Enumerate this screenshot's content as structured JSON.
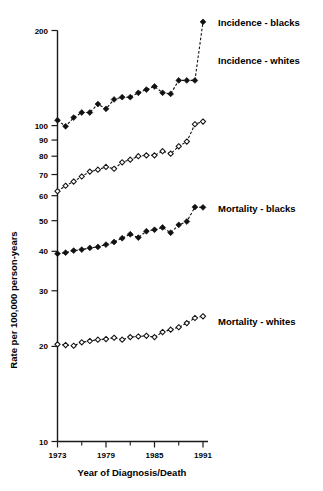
{
  "chart_data": {
    "type": "line",
    "title": "",
    "xlabel": "Year of Diagnosis/Death",
    "ylabel": "Rate per 100,000 person-years",
    "yscale": "log",
    "ylim": [
      10,
      230
    ],
    "xlim": [
      1972,
      1992
    ],
    "grid": false,
    "legend_position": "right-inline-labels",
    "y_ticks": [
      10,
      20,
      30,
      40,
      50,
      60,
      70,
      80,
      90,
      100,
      200
    ],
    "y_tick_labels": [
      "10",
      "20",
      "30",
      "40",
      "50",
      "60",
      "70",
      "80",
      "90",
      "100",
      "200"
    ],
    "x_ticks": [
      1973,
      1976,
      1979,
      1982,
      1985,
      1988,
      1991
    ],
    "x_tick_labels": [
      "1973",
      "",
      "1979",
      "",
      "1985",
      "",
      "1991"
    ],
    "x_major_labels": [
      "1973",
      "1979",
      "1985",
      "1991"
    ],
    "x": [
      1973,
      1974,
      1975,
      1976,
      1977,
      1978,
      1979,
      1980,
      1981,
      1982,
      1983,
      1984,
      1985,
      1986,
      1987,
      1988,
      1989,
      1990,
      1991
    ],
    "series": [
      {
        "name": "Incidence - blacks",
        "marker": "filled-diamond",
        "line": "dashed",
        "label_x": 1992.2,
        "label_y": 213,
        "values": [
          104,
          99.5,
          106,
          110,
          110,
          117,
          113,
          121,
          123,
          123,
          127,
          130,
          133,
          127,
          126,
          139,
          139,
          139,
          213
        ]
      },
      {
        "name": "Incidence - whites",
        "marker": "open-diamond",
        "line": "dashed",
        "label_x": 1992.2,
        "label_y": 150,
        "values": [
          62,
          64.5,
          66.5,
          69,
          71.5,
          72.5,
          74,
          73,
          76.5,
          78,
          80,
          80.5,
          80.5,
          83,
          81.5,
          86,
          89,
          101,
          103
        ]
      },
      {
        "name": "Mortality - blacks",
        "marker": "filled-diamond",
        "line": "dashed",
        "label_x": 1992.2,
        "label_y": 56,
        "values": [
          39.3,
          39.6,
          40.2,
          40.5,
          41,
          41.3,
          42,
          42.8,
          44,
          45.3,
          44.2,
          46.3,
          46.8,
          47.6,
          45.8,
          48.5,
          49.7,
          55.2,
          55.1
        ]
      },
      {
        "name": "Mortality - whites",
        "marker": "open-diamond",
        "line": "dashed",
        "label_x": 1992.2,
        "label_y": 25,
        "values": [
          20.3,
          20.2,
          20.1,
          20.6,
          20.8,
          21,
          21.1,
          21.3,
          21,
          21.4,
          21.5,
          21.6,
          21.4,
          22.2,
          22.6,
          23,
          23.7,
          24.6,
          24.9
        ]
      }
    ],
    "extra_points": {
      "incidence_whites_note": "1989-1991 rise: 89, 101, 103",
      "incidence_blacks_note": "1991 peak above 200 tick"
    }
  },
  "axis": {
    "x_title": "Year of Diagnosis/Death",
    "y_title": "Rate per 100,000 person-years"
  },
  "labels": {
    "incidence_blacks": "Incidence - blacks",
    "incidence_whites": "Incidence - whites",
    "mortality_blacks": "Mortality - blacks",
    "mortality_whites": "Mortality - whites"
  },
  "colors": {
    "foreground": "#111111",
    "background": "#ffffff",
    "marker_fill_closed": "#111111",
    "marker_fill_open": "#ffffff"
  }
}
